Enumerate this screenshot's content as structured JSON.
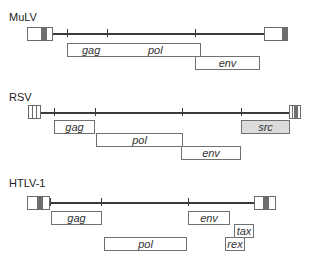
{
  "diagram": {
    "viruses": [
      {
        "name": "MuLV",
        "genes": [
          {
            "id": "gag",
            "label": "gag"
          },
          {
            "id": "pol",
            "label": "pol"
          },
          {
            "id": "env",
            "label": "env"
          }
        ]
      },
      {
        "name": "RSV",
        "genes": [
          {
            "id": "gag",
            "label": "gag"
          },
          {
            "id": "pol",
            "label": "pol"
          },
          {
            "id": "env",
            "label": "env"
          },
          {
            "id": "src",
            "label": "src"
          }
        ]
      },
      {
        "name": "HTLV-1",
        "genes": [
          {
            "id": "gag",
            "label": "gag"
          },
          {
            "id": "env",
            "label": "env"
          },
          {
            "id": "tax",
            "label": "tax"
          },
          {
            "id": "rex",
            "label": "rex"
          },
          {
            "id": "pol",
            "label": "pol"
          }
        ]
      }
    ],
    "colors": {
      "line": "#3a3a3a",
      "ltr_band": "#6e6e6e",
      "src_fill": "#dcdcdc",
      "box_border": "#707070"
    }
  }
}
